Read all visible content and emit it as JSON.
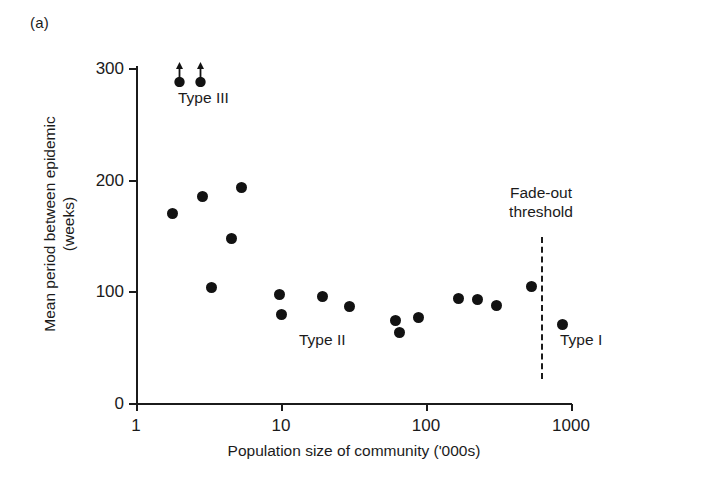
{
  "panel": {
    "label": "(a)"
  },
  "axes": {
    "y": {
      "title_line1": "Mean period between epidemic",
      "title_line2": "(weeks)",
      "ticks": [
        "0",
        "100",
        "200",
        "300"
      ]
    },
    "x": {
      "title": "Population size of community ('000s)",
      "ticks": [
        "1",
        "10",
        "100",
        "1000"
      ]
    }
  },
  "annotations": {
    "type3": "Type III",
    "type2": "Type II",
    "type1": "Type I",
    "fadeout_line1": "Fade-out",
    "fadeout_line2": "threshold"
  },
  "colors": {
    "marker": "#121212",
    "axis": "#1b1b1b",
    "background": "#ffffff"
  },
  "chart_data": {
    "type": "scatter",
    "title": "",
    "xlabel": "Population size of community ('000s)",
    "ylabel": "Mean period between epidemic (weeks)",
    "xscale": "log",
    "xlim": [
      1,
      1000
    ],
    "ylim": [
      0,
      300
    ],
    "xticks": [
      1,
      10,
      100,
      1000
    ],
    "yticks": [
      0,
      100,
      200,
      300
    ],
    "grid": false,
    "legend": false,
    "series": [
      {
        "name": "Type III (censored, period exceeds axis)",
        "marker": "filled-circle-with-up-arrow",
        "censored": true,
        "points": [
          {
            "x": 2.0,
            "y": 288,
            "censored": true
          },
          {
            "x": 2.8,
            "y": 288,
            "censored": true
          }
        ]
      },
      {
        "name": "Mean inter-epidemic period",
        "marker": "filled-circle",
        "censored": false,
        "points": [
          {
            "x": 1.8,
            "y": 170
          },
          {
            "x": 2.9,
            "y": 185
          },
          {
            "x": 3.3,
            "y": 103
          },
          {
            "x": 5.4,
            "y": 193
          },
          {
            "x": 4.6,
            "y": 147
          },
          {
            "x": 9.8,
            "y": 97
          },
          {
            "x": 10.2,
            "y": 79
          },
          {
            "x": 19.5,
            "y": 95
          },
          {
            "x": 30.0,
            "y": 86
          },
          {
            "x": 62.0,
            "y": 74
          },
          {
            "x": 66.0,
            "y": 63
          },
          {
            "x": 90.0,
            "y": 77
          },
          {
            "x": 170.0,
            "y": 94
          },
          {
            "x": 230.0,
            "y": 93
          },
          {
            "x": 310.0,
            "y": 87
          },
          {
            "x": 540.0,
            "y": 104
          },
          {
            "x": 880.0,
            "y": 70
          }
        ]
      }
    ],
    "reference_lines": [
      {
        "name": "Fade-out threshold",
        "orientation": "vertical",
        "x": 200,
        "style": "dashed",
        "label_line1": "Fade-out",
        "label_line2": "threshold"
      }
    ],
    "annotations": [
      {
        "text": "Type III",
        "x": 2.3,
        "y": 262
      },
      {
        "text": "Type II",
        "x": 16.0,
        "y": 48
      },
      {
        "text": "Type I",
        "x": 330.0,
        "y": 48
      }
    ]
  }
}
